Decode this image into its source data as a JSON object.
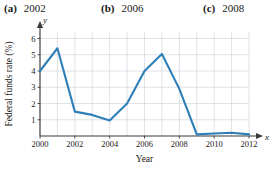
{
  "choices": [
    {
      "tag": "(a)",
      "value": "2002"
    },
    {
      "tag": "(b)",
      "value": "2006"
    },
    {
      "tag": "(c)",
      "value": "2008"
    }
  ],
  "axes": {
    "x_var": "x",
    "y_var": "y"
  },
  "colors": {
    "line": "#2e7fb8",
    "grid": "#c9cfd6",
    "axis": "#3a3a3a"
  },
  "chart_data": {
    "type": "line",
    "title": "",
    "xlabel": "Year",
    "ylabel": "Federal funds rate (%)",
    "x": [
      2000,
      2001,
      2002,
      2003,
      2004,
      2005,
      2006,
      2007,
      2008,
      2009,
      2010,
      2011,
      2012
    ],
    "values": [
      4.0,
      5.4,
      1.5,
      1.3,
      0.95,
      2.0,
      4.0,
      5.05,
      2.9,
      0.1,
      0.15,
      0.2,
      0.1
    ],
    "series": [
      {
        "name": "Federal funds rate",
        "values": [
          4.0,
          5.4,
          1.5,
          1.3,
          0.95,
          2.0,
          4.0,
          5.05,
          2.9,
          0.1,
          0.15,
          0.2,
          0.1
        ]
      }
    ],
    "xlim": [
      2000,
      2012
    ],
    "ylim": [
      0,
      6.4
    ],
    "xticks": [
      2000,
      2002,
      2004,
      2006,
      2008,
      2010,
      2012
    ],
    "xtick_labels": [
      "2000",
      "2002",
      "2004",
      "2006",
      "2008",
      "2010",
      "2012"
    ],
    "yticks": [
      1,
      2,
      3,
      4,
      5,
      6
    ],
    "ytick_labels": [
      "1",
      "2",
      "3",
      "4",
      "5",
      "6"
    ],
    "grid": true,
    "legend": "none"
  }
}
